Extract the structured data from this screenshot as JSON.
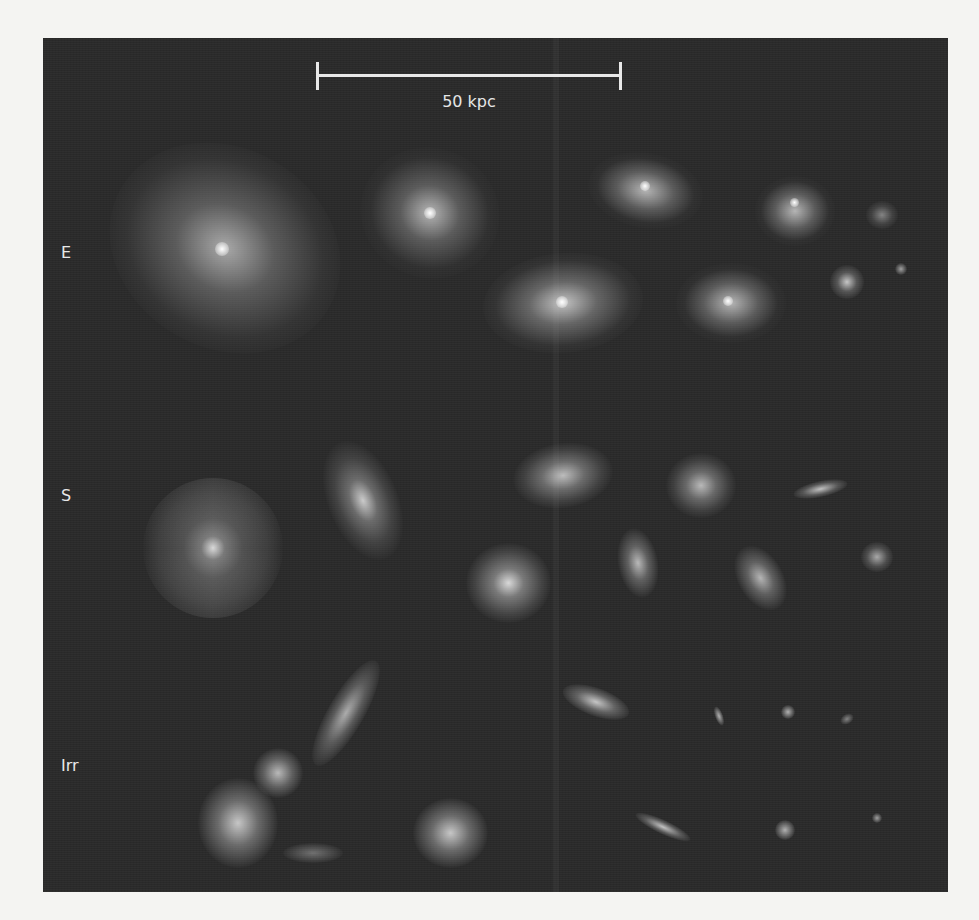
{
  "figure": {
    "scale_bar": {
      "label": "50 kpc"
    },
    "row_labels": [
      {
        "id": "E",
        "label": "E"
      },
      {
        "id": "S",
        "label": "S"
      },
      {
        "id": "Irr",
        "label": "Irr"
      }
    ],
    "colors": {
      "panel_background": "#2a2a2a",
      "page_background": "#f4f4f2",
      "text": "#e8e8e8"
    }
  }
}
